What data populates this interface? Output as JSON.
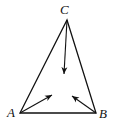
{
  "diagram": {
    "type": "triangle with vectors",
    "vertices": {
      "A": {
        "label": "A"
      },
      "B": {
        "label": "B"
      },
      "C": {
        "label": "C"
      }
    },
    "vectors": [
      "from A toward interior",
      "from B toward interior",
      "from C toward interior"
    ],
    "stroke_color": "#111111"
  }
}
